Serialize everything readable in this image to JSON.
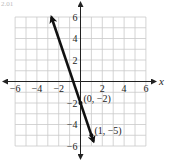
{
  "header": {
    "corner_text": "2.01"
  },
  "chart_data": {
    "type": "line",
    "title": "",
    "xlabel": "x",
    "ylabel": "",
    "xlim": [
      -6,
      6
    ],
    "ylim": [
      -6,
      6
    ],
    "grid": true,
    "x_ticks": [
      -6,
      -4,
      -2,
      2,
      4,
      6
    ],
    "y_ticks": [
      6,
      4,
      2,
      -2,
      -4,
      -6
    ],
    "x_tick_labels": [
      "−6",
      "−4",
      "−2",
      "2",
      "4",
      "6"
    ],
    "y_tick_labels": [
      "6",
      "4",
      "2",
      "−2",
      "−4",
      "−6"
    ],
    "series": [
      {
        "name": "y = -3x - 2",
        "slope": -3,
        "intercept": -2,
        "x": [
          -2.67,
          1.2
        ],
        "y": [
          6,
          -5.6
        ],
        "arrows": "both"
      }
    ],
    "annotations": [
      {
        "text": "(0, −2)",
        "x": 0,
        "y": -2
      },
      {
        "text": "(1, −5)",
        "x": 1,
        "y": -5
      }
    ]
  }
}
